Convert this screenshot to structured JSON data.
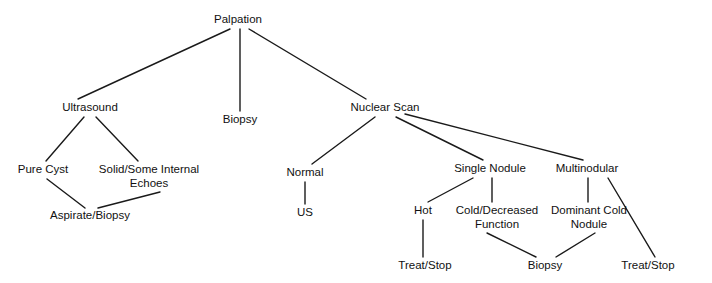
{
  "diagram": {
    "type": "tree-flowchart",
    "background_color": "#ffffff",
    "line_color": "#1a1a1a",
    "text_color": "#111111",
    "nodes": [
      {
        "id": "palpation",
        "label": "Palpation",
        "lines": [
          "Palpation"
        ],
        "x": 238,
        "y": 23
      },
      {
        "id": "ultrasound",
        "label": "Ultrasound",
        "lines": [
          "Ultrasound"
        ],
        "x": 90,
        "y": 111
      },
      {
        "id": "biopsy_top",
        "label": "Biopsy",
        "lines": [
          "Biopsy"
        ],
        "x": 240,
        "y": 123
      },
      {
        "id": "nuclear_scan",
        "label": "Nuclear Scan",
        "lines": [
          "Nuclear Scan"
        ],
        "x": 385,
        "y": 111
      },
      {
        "id": "pure_cyst",
        "label": "Pure Cyst",
        "lines": [
          "Pure Cyst"
        ],
        "x": 43,
        "y": 173
      },
      {
        "id": "solid_echoes",
        "label": "Solid/Some Internal Echoes",
        "lines": [
          "Solid/Some Internal",
          "Echoes"
        ],
        "x": 149,
        "y": 173
      },
      {
        "id": "aspirate",
        "label": "Aspirate/Biopsy",
        "lines": [
          "Aspirate/Biopsy"
        ],
        "x": 90,
        "y": 219
      },
      {
        "id": "normal",
        "label": "Normal",
        "lines": [
          "Normal"
        ],
        "x": 305,
        "y": 176
      },
      {
        "id": "us",
        "label": "US",
        "lines": [
          "US"
        ],
        "x": 305,
        "y": 216
      },
      {
        "id": "single_nodule",
        "label": "Single Nodule",
        "lines": [
          "Single Nodule"
        ],
        "x": 490,
        "y": 172
      },
      {
        "id": "multinodular",
        "label": "Multinodular",
        "lines": [
          "Multinodular"
        ],
        "x": 587,
        "y": 172
      },
      {
        "id": "hot",
        "label": "Hot",
        "lines": [
          "Hot"
        ],
        "x": 423,
        "y": 214
      },
      {
        "id": "cold_decreased",
        "label": "Cold/Decreased Function",
        "lines": [
          "Cold/Decreased",
          "Function"
        ],
        "x": 497,
        "y": 214
      },
      {
        "id": "dominant_cold",
        "label": "Dominant Cold Nodule",
        "lines": [
          "Dominant Cold",
          "Nodule"
        ],
        "x": 589,
        "y": 214
      },
      {
        "id": "treat_stop_l",
        "label": "Treat/Stop",
        "lines": [
          "Treat/Stop"
        ],
        "x": 425,
        "y": 269
      },
      {
        "id": "biopsy_bottom",
        "label": "Biopsy",
        "lines": [
          "Biopsy"
        ],
        "x": 545,
        "y": 269
      },
      {
        "id": "treat_stop_r",
        "label": "Treat/Stop",
        "lines": [
          "Treat/Stop"
        ],
        "x": 648,
        "y": 269
      }
    ],
    "edges": [
      {
        "id": "e-palpation-ultrasound",
        "from": "palpation",
        "to": "ultrasound",
        "x1": 230,
        "y1": 29,
        "x2": 78,
        "y2": 99
      },
      {
        "id": "e-palpation-biopsy",
        "from": "palpation",
        "to": "biopsy_top",
        "x1": 240,
        "y1": 29,
        "x2": 240,
        "y2": 111
      },
      {
        "id": "e-palpation-nuclear",
        "from": "palpation",
        "to": "nuclear_scan",
        "x1": 249,
        "y1": 29,
        "x2": 366,
        "y2": 99
      },
      {
        "id": "e-ultrasound-purecyst",
        "from": "ultrasound",
        "to": "pure_cyst",
        "x1": 84,
        "y1": 117,
        "x2": 46,
        "y2": 161
      },
      {
        "id": "e-ultrasound-solid",
        "from": "ultrasound",
        "to": "solid_echoes",
        "x1": 96,
        "y1": 117,
        "x2": 138,
        "y2": 161
      },
      {
        "id": "e-purecyst-aspirate",
        "from": "pure_cyst",
        "to": "aspirate",
        "x1": 47,
        "y1": 179,
        "x2": 85,
        "y2": 208
      },
      {
        "id": "e-solid-aspirate",
        "from": "solid_echoes",
        "to": "aspirate",
        "x1": 160,
        "y1": 192,
        "x2": 98,
        "y2": 208
      },
      {
        "id": "e-nuclear-normal",
        "from": "nuclear_scan",
        "to": "normal",
        "x1": 375,
        "y1": 117,
        "x2": 312,
        "y2": 164
      },
      {
        "id": "e-normal-us",
        "from": "normal",
        "to": "us",
        "x1": 305,
        "y1": 182,
        "x2": 305,
        "y2": 204
      },
      {
        "id": "e-nuclear-single",
        "from": "nuclear_scan",
        "to": "single_nodule",
        "x1": 396,
        "y1": 117,
        "x2": 483,
        "y2": 160
      },
      {
        "id": "e-nuclear-multi",
        "from": "nuclear_scan",
        "to": "multinodular",
        "x1": 405,
        "y1": 114,
        "x2": 583,
        "y2": 160
      },
      {
        "id": "e-single-hot",
        "from": "single_nodule",
        "to": "hot",
        "x1": 473,
        "y1": 178,
        "x2": 428,
        "y2": 202
      },
      {
        "id": "e-single-cold",
        "from": "single_nodule",
        "to": "cold_decreased",
        "x1": 492,
        "y1": 178,
        "x2": 492,
        "y2": 202
      },
      {
        "id": "e-multi-dominant",
        "from": "multinodular",
        "to": "dominant_cold",
        "x1": 588,
        "y1": 178,
        "x2": 588,
        "y2": 202
      },
      {
        "id": "e-multi-treatstop",
        "from": "multinodular",
        "to": "treat_stop_r",
        "x1": 608,
        "y1": 178,
        "x2": 655,
        "y2": 257
      },
      {
        "id": "e-hot-treatstop",
        "from": "hot",
        "to": "treat_stop_l",
        "x1": 423,
        "y1": 220,
        "x2": 423,
        "y2": 257
      },
      {
        "id": "e-cold-biopsy",
        "from": "cold_decreased",
        "to": "biopsy_bottom",
        "x1": 487,
        "y1": 233,
        "x2": 536,
        "y2": 257
      },
      {
        "id": "e-dominant-biopsy",
        "from": "dominant_cold",
        "to": "biopsy_bottom",
        "x1": 595,
        "y1": 233,
        "x2": 556,
        "y2": 257
      }
    ]
  }
}
